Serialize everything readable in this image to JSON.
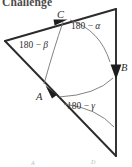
{
  "figure": {
    "heading": "Challenge",
    "caption_cut_off": true,
    "background_color": "#ffffff",
    "stroke_color": "#2b2b2b",
    "arc_color": "#6b6b6b",
    "heading_color": "#4a4a4a",
    "faint_label_color": "#b6b6b6",
    "vertex_labels": [
      {
        "name": "C",
        "text": "C",
        "x": 62,
        "y": 17,
        "arrow_direction": "up-right"
      },
      {
        "name": "B",
        "text": "B",
        "x": 122,
        "y": 70,
        "arrow_direction": "down"
      },
      {
        "name": "A",
        "text": "A",
        "x": 42,
        "y": 97,
        "arrow_direction": "up-left"
      }
    ],
    "angle_labels": [
      {
        "name": "alpha",
        "prefix": "180 ",
        "minus": "− ",
        "symbol": "α",
        "x": 85,
        "y": 27
      },
      {
        "name": "beta",
        "prefix": "180 ",
        "minus": "− ",
        "symbol": "β",
        "x": 35,
        "y": 45
      },
      {
        "name": "gamma",
        "prefix": "180 ",
        "minus": "− ",
        "symbol": "γ",
        "x": 86,
        "y": 106
      }
    ],
    "foot_labels": [
      {
        "name": "A",
        "text": "A",
        "x": 33,
        "y": 162
      },
      {
        "name": "D",
        "text": "D",
        "x": 93,
        "y": 161
      }
    ],
    "geometry": {
      "vertices": {
        "left": {
          "x": 5,
          "y": 41
        },
        "top_right": {
          "x": 116,
          "y": 9
        },
        "bottom_right": {
          "x": 116,
          "y": 156
        }
      },
      "edges": [
        {
          "name": "edge-left-to-topright",
          "from": "left",
          "to": "top_right",
          "vector": "C"
        },
        {
          "name": "edge-topright-to-botright",
          "from": "top_right",
          "to": "bottom_right",
          "vector": "B"
        },
        {
          "name": "edge-botright-to-left",
          "from": "bottom_right",
          "to": "left",
          "vector": "A"
        }
      ]
    }
  }
}
